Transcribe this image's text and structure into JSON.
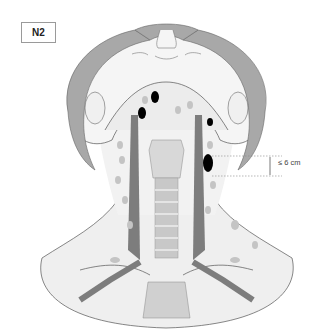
{
  "figure": {
    "stage_label": "N2",
    "measurement_label": "≤ 6 cm",
    "colors": {
      "skin": "#f2f2f2",
      "hair": "#a8a8a8",
      "outline": "#555555",
      "vessel": "#7d7d7d",
      "lymph_node_benign": "#c4c4c4",
      "lymph_node_involved": "#000000",
      "larynx_trachea": "#cfcfcf"
    },
    "involved_nodes": [
      {
        "side": "left",
        "position": "upper jugular",
        "shape": "oval"
      },
      {
        "side": "left",
        "position": "submandibular",
        "shape": "oval"
      },
      {
        "side": "right",
        "position": "upper jugular",
        "shape": "small oval"
      },
      {
        "side": "right",
        "position": "mid jugular",
        "shape": "large oval",
        "measured": true
      }
    ]
  }
}
